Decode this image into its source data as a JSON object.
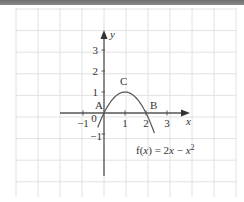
{
  "header_bar": {
    "color": "#7a7a7a"
  },
  "chart_data": {
    "type": "line",
    "title": "",
    "function_label": "f(x) = 2x − x²",
    "function_label_parts": {
      "prefix": "f(",
      "var": "x",
      "mid": ") = 2",
      "var2": "x",
      "minus": " − ",
      "var3": "x",
      "exp": "2"
    },
    "xlabel": "x",
    "ylabel": "y",
    "xlim": [
      -2,
      4
    ],
    "ylim": [
      -4,
      4
    ],
    "x_ticks": [
      -1,
      1,
      2,
      3
    ],
    "x_tick_labels": [
      "−1",
      "1",
      "2",
      "3"
    ],
    "y_ticks": [
      -1,
      1,
      2,
      3
    ],
    "y_tick_labels": [
      "−1",
      "1",
      "2",
      "3"
    ],
    "origin_label": "0",
    "grid": true,
    "series": [
      {
        "name": "f(x) = 2x − x²",
        "x": [
          -0.3,
          0,
          0.5,
          1,
          1.5,
          2,
          2.4
        ],
        "y": [
          -0.69,
          0,
          0.75,
          1,
          0.75,
          0,
          -0.96
        ]
      }
    ],
    "annotations": [
      {
        "label": "A",
        "x": 0,
        "y": 0
      },
      {
        "label": "B",
        "x": 2,
        "y": 0
      },
      {
        "label": "C",
        "x": 1,
        "y": 1
      }
    ]
  }
}
